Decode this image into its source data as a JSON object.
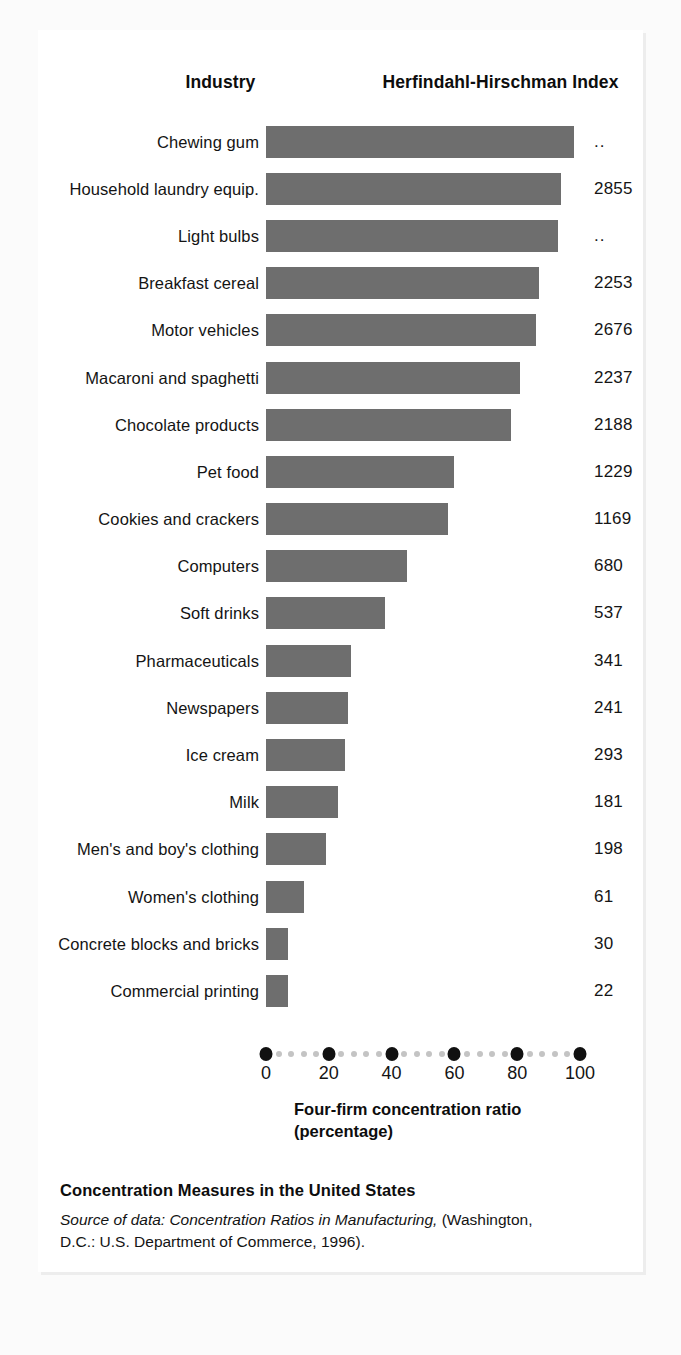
{
  "headers": {
    "industry": "Industry",
    "hhi": "Herfindahl-Hirschman Index"
  },
  "axis": {
    "ticks": [
      "0",
      "20",
      "40",
      "60",
      "80",
      "100"
    ],
    "title_line1": "Four-firm concentration ratio",
    "title_line2": "(percentage)"
  },
  "footer": {
    "title": "Concentration Measures in the United States",
    "source_prefix": "Source of data: Concentration Ratios in Manufacturing,",
    "source_rest": " (Washington,",
    "source_line2": "D.C.: U.S. Department of Commerce, 1996)."
  },
  "colors": {
    "bar": "#6e6e6e",
    "tick_major": "#111111",
    "tick_minor": "#c4c4c4",
    "card": "#ffffff",
    "page": "#fbfbfb",
    "text": "#141414"
  },
  "chart_data": {
    "type": "bar",
    "orientation": "horizontal",
    "title": "Concentration Measures in the United States",
    "xlabel": "Four-firm concentration ratio (percentage)",
    "ylabel": "Industry",
    "xlim": [
      0,
      100
    ],
    "grid": false,
    "legend": "none",
    "value_column_header": "Herfindahl-Hirschman Index",
    "categories": [
      "Chewing gum",
      "Household laundry equip.",
      "Light bulbs",
      "Breakfast cereal",
      "Motor vehicles",
      "Macaroni and spaghetti",
      "Chocolate products",
      "Pet food",
      "Cookies and crackers",
      "Computers",
      "Soft drinks",
      "Pharmaceuticals",
      "Newspapers",
      "Ice cream",
      "Milk",
      "Men's and boy's clothing",
      "Women's clothing",
      "Concrete blocks and bricks",
      "Commercial printing"
    ],
    "values": [
      98,
      94,
      93,
      87,
      86,
      81,
      78,
      60,
      58,
      45,
      38,
      27,
      26,
      25,
      23,
      19,
      12,
      7,
      7
    ],
    "hhi": [
      "..",
      "2855",
      "..",
      "2253",
      "2676",
      "2237",
      "2188",
      "1229",
      "1169",
      "680",
      "537",
      "341",
      "241",
      "293",
      "181",
      "198",
      "61",
      "30",
      "22"
    ]
  }
}
